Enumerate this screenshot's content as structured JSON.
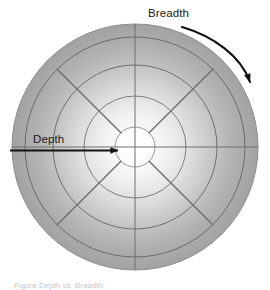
{
  "figure": {
    "title_label": "Depth",
    "caption": "Figure  Depth vs. Breadth",
    "labels": {
      "depth": "Depth",
      "breadth": "Breadth"
    },
    "colors": {
      "disc_center": "#fdfdfd",
      "disc_edge": "#a3a3a3",
      "ring_line": "#6e6e6e",
      "spoke_line": "#6e6e6e",
      "arrow": "#111111",
      "label_text": "#1a1a1a",
      "background": "#ffffff"
    },
    "icons": {
      "depth_arrow": "straight-arrow-right-icon",
      "breadth_arrow": "curved-arrow-clockwise-icon"
    }
  },
  "chart_data": {
    "type": "polar-grid-diagram",
    "xlabel": "",
    "ylabel": "",
    "center": {
      "x": 135,
      "y": 147
    },
    "outer_radius": 123,
    "ring_radii": [
      20,
      51,
      82,
      110,
      123
    ],
    "ring_count": 5,
    "spoke_count": 8,
    "spoke_angles_deg": [
      0,
      45,
      90,
      135,
      180,
      225,
      270,
      315
    ],
    "annotations": [
      {
        "text": "Depth",
        "kind": "straight-arrow",
        "direction": "inward-horizontal",
        "from": {
          "x": 10,
          "y": 150
        },
        "to": {
          "x": 122,
          "y": 150
        },
        "label_pos": {
          "x": 33,
          "y": 142
        }
      },
      {
        "text": "Breadth",
        "kind": "curved-arrow",
        "direction": "clockwise",
        "from": {
          "x": 182,
          "y": 27
        },
        "to": {
          "x": 252,
          "y": 86
        },
        "label_pos": {
          "x": 148,
          "y": 16
        }
      }
    ],
    "grid": true,
    "legend": "none"
  }
}
